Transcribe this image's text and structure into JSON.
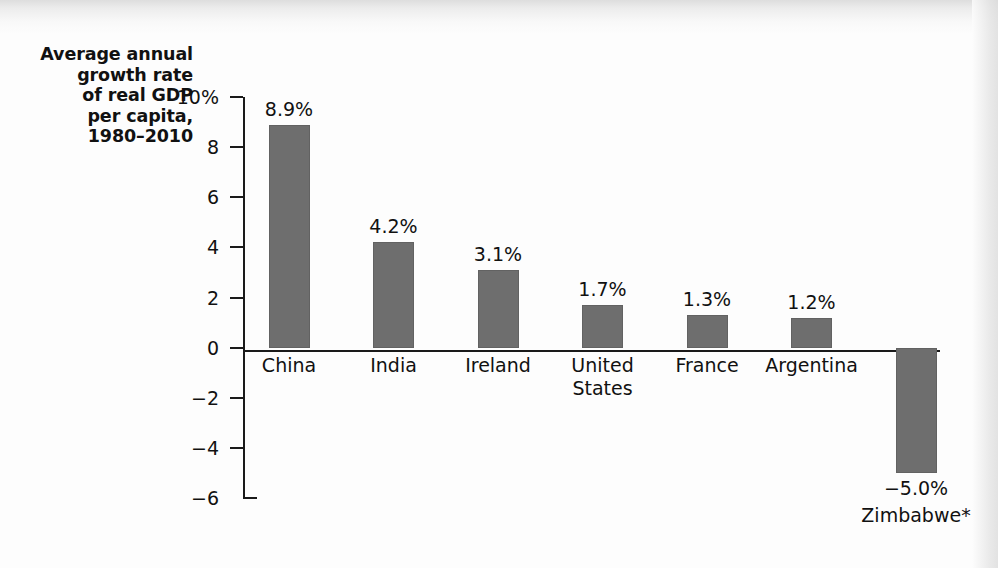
{
  "chart_data": {
    "type": "bar",
    "title": "Average annual growth rate of real GDP per capita, 1980–2010",
    "title_lines": [
      "Average annual",
      "growth rate",
      "of real GDP",
      "per capita,",
      "1980–2010"
    ],
    "xlabel": "",
    "ylabel": "Average annual growth rate of real GDP per capita, 1980–2010",
    "ylim": [
      -6,
      10
    ],
    "grid": false,
    "legend": "none",
    "bar_color": "#6e6e6e",
    "axis_color": "#1a1a1a",
    "background_color": "#fdfdfd",
    "ytick_labels": [
      "10%",
      "8",
      "6",
      "4",
      "2",
      "0",
      "−2",
      "−4",
      "−6"
    ],
    "ytick_values": [
      10,
      8,
      6,
      4,
      2,
      0,
      -2,
      -4,
      -6
    ],
    "categories": [
      "China",
      "India",
      "Ireland",
      "United States",
      "France",
      "Argentina",
      "Zimbabwe*"
    ],
    "values": [
      8.9,
      4.2,
      3.1,
      1.7,
      1.3,
      1.2,
      -5.0
    ],
    "value_labels": [
      "8.9%",
      "4.2%",
      "3.1%",
      "1.7%",
      "1.3%",
      "1.2%",
      "−5.0%"
    ],
    "category_label_lines": [
      [
        "China"
      ],
      [
        "India"
      ],
      [
        "Ireland"
      ],
      [
        "United",
        "States"
      ],
      [
        "France"
      ],
      [
        "Argentina"
      ],
      [
        "Zimbabwe*"
      ]
    ]
  }
}
